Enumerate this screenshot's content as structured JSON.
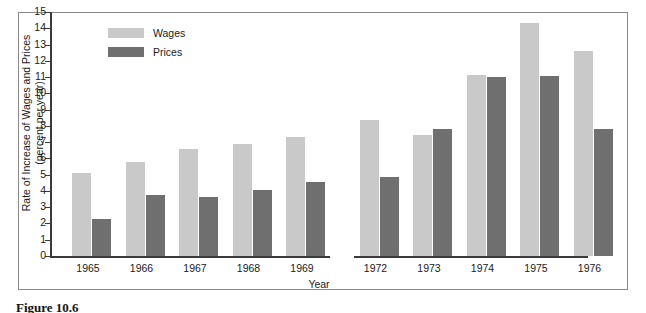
{
  "figure": {
    "caption": "Figure 10.6"
  },
  "legend": {
    "position": "top-left",
    "items": [
      {
        "label": "Wages",
        "color": "#c9c9c9"
      },
      {
        "label": "Prices",
        "color": "#6f6f6f"
      }
    ]
  },
  "axes": {
    "y_title_line1": "Rate of Increase of Wages and Prices",
    "y_title_line2": "(percent per year)",
    "x_title": "Year",
    "y_ticks": [
      "0",
      "1",
      "2",
      "3",
      "4",
      "5",
      "6",
      "7",
      "8",
      "9",
      "10",
      "11",
      "12",
      "13",
      "14",
      "15"
    ]
  },
  "chart_data": {
    "type": "bar",
    "title": "",
    "subtitle": "",
    "xlabel": "Year",
    "ylabel": "Rate of Increase of Wages and Prices (percent per year)",
    "ylim": [
      0,
      15
    ],
    "ytick_step": 1,
    "grid": false,
    "legend_position": "top-left",
    "axis_break_after_category": "1969",
    "categories": [
      "1965",
      "1966",
      "1967",
      "1968",
      "1969",
      "1972",
      "1973",
      "1974",
      "1975",
      "1976"
    ],
    "series": [
      {
        "name": "Wages",
        "color": "#c9c9c9",
        "values": [
          5.1,
          5.75,
          6.6,
          6.9,
          7.3,
          8.35,
          7.45,
          11.1,
          14.3,
          12.6
        ]
      },
      {
        "name": "Prices",
        "color": "#6f6f6f",
        "values": [
          2.3,
          3.75,
          3.6,
          4.05,
          4.55,
          4.85,
          7.8,
          11.0,
          11.05,
          7.8
        ]
      }
    ]
  }
}
